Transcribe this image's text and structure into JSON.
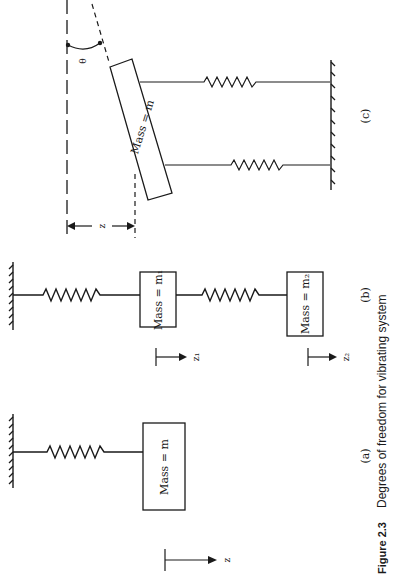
{
  "figure": {
    "caption_label": "Figure 2.3",
    "caption_text": "Degrees of freedom for vibrating system",
    "orientation": "rotated 90° (landscape figure on portrait page)"
  },
  "panels": {
    "a": {
      "label": "(a)",
      "mass_label": "Mass = m",
      "displacement_label": "z"
    },
    "b": {
      "label": "(b)",
      "mass1_label": "Mass = m₁",
      "mass2_label": "Mass = m₂",
      "displacement1_label": "z₁",
      "displacement2_label": "z₂"
    },
    "c": {
      "label": "(c)",
      "mass_label": "Mass = m",
      "displacement_label": "z",
      "angle_label": "θ"
    }
  },
  "colors": {
    "ink": "#1a1a1a",
    "paper": "#ffffff"
  }
}
